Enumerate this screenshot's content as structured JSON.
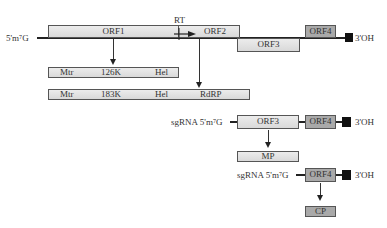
{
  "genome": {
    "five_prime": "5'm⁷G",
    "three_prime": "3'OH",
    "orfs": [
      {
        "id": "orf1",
        "label": "ORF1"
      },
      {
        "id": "orf2",
        "label": "ORF2"
      },
      {
        "id": "orf3",
        "label": "ORF3"
      },
      {
        "id": "orf4",
        "label": "ORF4"
      }
    ],
    "readthrough_label": "RT"
  },
  "proteins": {
    "p126": {
      "center": "126K",
      "domains": [
        "Mtr",
        "Hel"
      ]
    },
    "p183": {
      "center": "183K",
      "domains": [
        "Mtr",
        "Hel",
        "RdRP"
      ]
    }
  },
  "sgrna1": {
    "prefix": "sgRNA 5'm⁷G",
    "orf3": "ORF3",
    "orf4": "ORF4",
    "three_prime": "3'OH",
    "product": "MP"
  },
  "sgrna2": {
    "prefix": "sgRNA 5'm⁷G",
    "orf4": "ORF4",
    "three_prime": "3'OH",
    "product": "CP"
  },
  "colors": {
    "light_box": "#e2e2e2",
    "dark_box": "#a9a9a9",
    "line": "#222222",
    "terminal": "#111111"
  }
}
